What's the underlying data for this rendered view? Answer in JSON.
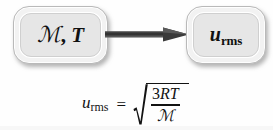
{
  "figure": {
    "type": "process-diagram-with-equation",
    "background_color": "#fefefe",
    "text_color": "#121212"
  },
  "diagram": {
    "nodes": [
      {
        "id": "inputs",
        "label_plain": "M, T",
        "script_m": "ℳ",
        "comma": ",",
        "italic_t": "T",
        "meaning": "molar mass and temperature",
        "fill_color": "#e6e6e6",
        "border_color": "#b9b9b9"
      },
      {
        "id": "output",
        "label_plain": "u_rms",
        "variable": "u",
        "subscript": "rms",
        "meaning": "root-mean-square speed",
        "fill_color": "#e6e6e6",
        "border_color": "#b9b9b9"
      }
    ],
    "arrow": {
      "direction": "left-to-right",
      "color": "#3a3a3a",
      "name": "flow-arrow"
    }
  },
  "equation": {
    "lhs_variable": "u",
    "lhs_subscript": "rms",
    "equals": "=",
    "radical_symbol": "√",
    "numerator_coefficient": "3",
    "numerator_symbols": "RT",
    "numerator_plain": "3RT",
    "denominator": "ℳ",
    "full_plain": "u_rms = sqrt(3RT / M)"
  }
}
